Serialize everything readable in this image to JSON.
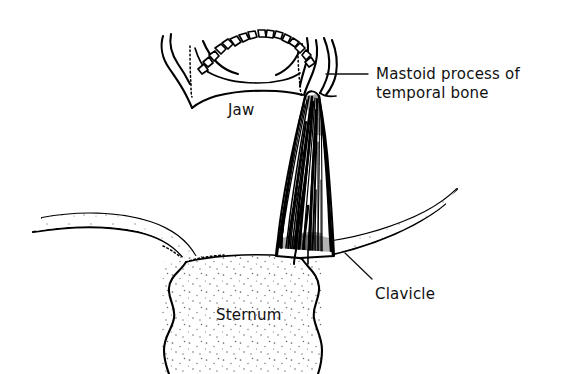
{
  "figure": {
    "background_color": "#ffffff",
    "ink_color": "#000000",
    "style": "black-and-white line drawing with stippled bone"
  },
  "labels": {
    "mastoid": {
      "line1": "Mastoid process of",
      "line2": "temporal bone"
    },
    "jaw": "Jaw",
    "clavicle": "Clavicle",
    "sternum": "Sternum"
  },
  "structures": [
    {
      "name": "jaw",
      "label": "Jaw",
      "description": "mandible seen from below with dental arch"
    },
    {
      "name": "teeth",
      "label": "",
      "count": 16,
      "description": "row of teeth along dental arch"
    },
    {
      "name": "mastoid-process",
      "label": "Mastoid process of temporal bone",
      "description": "hook-shaped bony projection behind the jaw"
    },
    {
      "name": "sternocleidomastoid-muscle",
      "label": "",
      "description": "striated muscle running from mastoid process to sternum and clavicle"
    },
    {
      "name": "clavicle-left",
      "label": "Clavicle",
      "description": "collarbone curving to sternum"
    },
    {
      "name": "clavicle-right",
      "label": "Clavicle",
      "description": "collarbone curving to sternum"
    },
    {
      "name": "sternum",
      "label": "Sternum",
      "description": "breastbone, stippled, cut off at lower edge"
    }
  ]
}
